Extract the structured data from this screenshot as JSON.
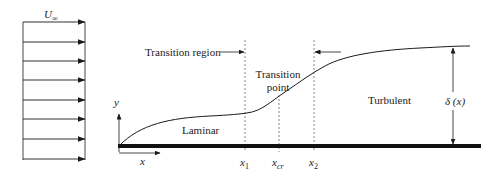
{
  "diagram": {
    "freestream": {
      "label_symbol": "U",
      "label_subscript": "∞",
      "arrow_count": 8
    },
    "axes": {
      "y_label": "y",
      "x_label": "x"
    },
    "regions": {
      "laminar": "Laminar",
      "transition_region": "Transition region",
      "transition_point_line1": "Transition",
      "transition_point_line2": "point",
      "turbulent": "Turbulent"
    },
    "stations": {
      "x1_main": "x",
      "x1_sub": "1",
      "xcr_main": "x",
      "xcr_sub": "cr",
      "x2_main": "x",
      "x2_sub": "2"
    },
    "thickness": {
      "label": "δ (x)"
    },
    "colors": {
      "ink": "#1a1a1a",
      "plate": "#111111",
      "dashed": "#555555",
      "background": "#ffffff"
    }
  }
}
